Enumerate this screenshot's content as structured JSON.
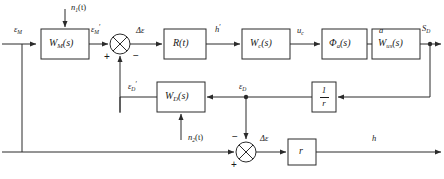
{
  "diagram": {
    "stroke_color": "#2b2b2b",
    "text_color": "#1a1a1a",
    "background": "#ffffff"
  },
  "blocks": [
    {
      "id": "w_m",
      "label_base": "W",
      "label_sub": "M",
      "label_tail": "(s)",
      "name": "block-w-m"
    },
    {
      "id": "r_t",
      "label_base": "R",
      "label_sub": "",
      "label_tail": "(t)",
      "name": "block-r-t"
    },
    {
      "id": "w_c",
      "label_base": "W",
      "label_sub": "c",
      "label_tail": "(s)",
      "name": "block-w-c"
    },
    {
      "id": "phi_a",
      "label_base": "Φ",
      "label_sub": "a",
      "label_tail": "(s)",
      "name": "block-phi-a"
    },
    {
      "id": "w_us",
      "label_base": "W",
      "label_sub": "us",
      "label_tail": "(s)",
      "name": "block-w-us"
    },
    {
      "id": "w_d",
      "label_base": "W",
      "label_sub": "D",
      "label_tail": "(s)",
      "name": "block-w-d"
    },
    {
      "id": "inv_r",
      "label_base": "1/r",
      "label_sub": "",
      "label_tail": "",
      "name": "block-one-over-r"
    },
    {
      "id": "r_gain",
      "label_base": "r",
      "label_sub": "",
      "label_tail": "",
      "name": "block-r-gain"
    }
  ],
  "fraction_block": {
    "numerator": "1",
    "denominator": "r"
  },
  "signals": [
    {
      "id": "eps_m_in",
      "base": "ε",
      "sub": "M",
      "prime": false,
      "name": "signal-epsilon-m"
    },
    {
      "id": "n1",
      "base": "n",
      "sub": "1",
      "tail": "(t)",
      "name": "signal-n1-t"
    },
    {
      "id": "eps_m_pr",
      "base": "ε",
      "sub": "M",
      "prime": true,
      "name": "signal-epsilon-m-prime"
    },
    {
      "id": "delta_eps",
      "base": "Δε",
      "sub": "",
      "prime": false,
      "name": "signal-delta-epsilon-top"
    },
    {
      "id": "h_prime",
      "base": "h",
      "sub": "",
      "prime": true,
      "name": "signal-h-prime"
    },
    {
      "id": "u_c",
      "base": "u",
      "sub": "c",
      "prime": false,
      "name": "signal-u-c"
    },
    {
      "id": "a_sig",
      "base": "a",
      "sub": "",
      "prime": false,
      "name": "signal-a"
    },
    {
      "id": "s_d",
      "base": "S",
      "sub": "D",
      "prime": false,
      "name": "signal-s-d"
    },
    {
      "id": "eps_d_pr",
      "base": "ε",
      "sub": "D",
      "prime": true,
      "name": "signal-epsilon-d-prime"
    },
    {
      "id": "eps_d",
      "base": "ε",
      "sub": "D",
      "prime": false,
      "name": "signal-epsilon-d"
    },
    {
      "id": "n2",
      "base": "n",
      "sub": "2",
      "tail": "(t)",
      "name": "signal-n2-t"
    },
    {
      "id": "delta_eps_b",
      "base": "Δε",
      "sub": "",
      "prime": false,
      "name": "signal-delta-epsilon-bottom"
    },
    {
      "id": "h_out",
      "base": "h",
      "sub": "",
      "prime": false,
      "name": "signal-h-output"
    }
  ],
  "labels": {
    "eps_m_in": "ε",
    "eps_m_in_sub": "M",
    "n1": "n",
    "n1_sub": "1",
    "n1_tail": "(t)",
    "eps_m_prime": "ε",
    "eps_m_prime_sub": "M",
    "delta_eps_top": "Δε",
    "h_prime": "h",
    "u_c": "u",
    "u_c_sub": "c",
    "a": "a",
    "s_d": "S",
    "s_d_sub": "D",
    "eps_d_prime": "ε",
    "eps_d_prime_sub": "D",
    "eps_d": "ε",
    "eps_d_sub": "D",
    "n2": "n",
    "n2_sub": "2",
    "n2_tail": "(t)",
    "delta_eps_bottom": "Δε",
    "h_out": "h",
    "w_m_base": "W",
    "w_m_sub": "M",
    "w_m_tail": "(s)",
    "r_t": "R(t)",
    "w_c_base": "W",
    "w_c_sub": "c",
    "w_c_tail": "(s)",
    "phi_base": "Φ",
    "phi_sub": "a",
    "phi_tail": "(s)",
    "w_us_base": "W",
    "w_us_sub": "us",
    "w_us_tail": "(s)",
    "w_d_base": "W",
    "w_d_sub": "D",
    "w_d_tail": "(s)",
    "r_gain": "r",
    "frac_num": "1",
    "frac_den": "r"
  },
  "summing_junctions": [
    {
      "id": "sum_top",
      "name": "summing-junction-top",
      "signs": [
        {
          "symbol": "+",
          "position": "left-below",
          "name": "sign-plus-top-left"
        },
        {
          "symbol": "−",
          "position": "right-below",
          "name": "sign-minus-top-right"
        }
      ]
    },
    {
      "id": "sum_bottom",
      "name": "summing-junction-bottom",
      "signs": [
        {
          "symbol": "+",
          "position": "left-below",
          "name": "sign-plus-bottom-left"
        },
        {
          "symbol": "−",
          "position": "top-left",
          "name": "sign-minus-bottom-top"
        }
      ]
    }
  ],
  "signs": {
    "top_plus": "+",
    "top_minus": "−",
    "bottom_plus": "+",
    "bottom_minus": "−"
  }
}
